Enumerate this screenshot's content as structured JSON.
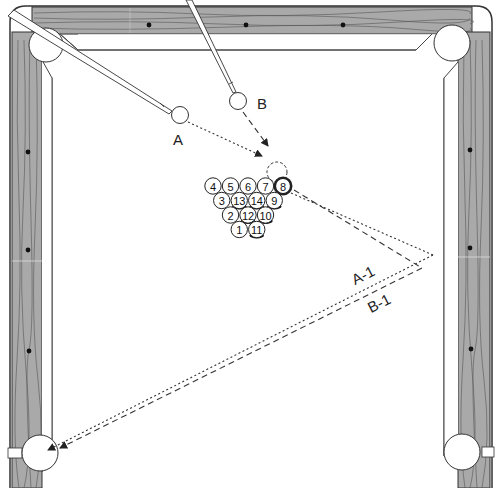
{
  "diagram": {
    "type": "pool-table-shot-diagram",
    "colors": {
      "rail_wood": "#a9a9a9",
      "rail_grain": "#555555",
      "cloth": "#ffffff",
      "outline": "#333333",
      "diamond": "#111111"
    },
    "cue_balls": [
      {
        "id": "A",
        "label": "A",
        "x": 180,
        "y": 115
      },
      {
        "id": "B",
        "label": "B",
        "x": 238,
        "y": 101
      }
    ],
    "ghost_ball": {
      "x": 272,
      "y": 156
    },
    "rack": {
      "rows": [
        [
          "4",
          "5",
          "6",
          "7",
          "8"
        ],
        [
          "3",
          "13",
          "14",
          "9"
        ],
        [
          "2",
          "12",
          "10"
        ],
        [
          "1",
          "11"
        ]
      ]
    },
    "paths": [
      {
        "id": "A-1",
        "label": "A-1",
        "style": "dotted"
      },
      {
        "id": "B-1",
        "label": "B-1",
        "style": "dashed"
      }
    ],
    "pockets": [
      "top-left",
      "top-right",
      "bottom-left",
      "bottom-right"
    ],
    "target_pocket": "bottom-left"
  }
}
